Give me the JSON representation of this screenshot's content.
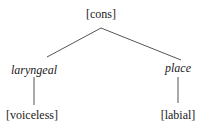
{
  "diagram": {
    "type": "feature-geometry-tree",
    "root": {
      "label": "[cons]",
      "style": "normal"
    },
    "children": [
      {
        "label": "laryngeal",
        "style": "italic",
        "children": [
          {
            "label": "[voiceless]",
            "style": "normal"
          }
        ]
      },
      {
        "label": "place",
        "style": "italic",
        "children": [
          {
            "label": "[labial]",
            "style": "normal"
          }
        ]
      }
    ],
    "colors": {
      "text": "#1a1a1a",
      "edge": "#555555",
      "background": "#ffffff"
    }
  }
}
